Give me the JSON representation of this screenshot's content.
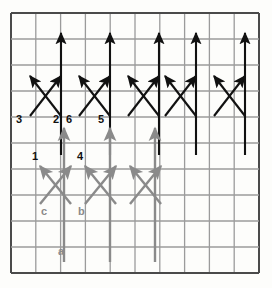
{
  "figure": {
    "background_color": "#fdfdfb",
    "dark_color": "#111111",
    "gray_color": "#8a8a8a",
    "grid_line_color": "#4a4a4a",
    "grid_minor_color": "#9b9b9b"
  },
  "grid": {
    "x0": 11,
    "y0": 13,
    "x1": 259,
    "y1": 273,
    "cols": 10,
    "rows": 10,
    "border_width": 2.0,
    "line_width": 1.3
  },
  "chart_data": {
    "type": "scatter",
    "xlabel": "",
    "ylabel": "",
    "legend": [],
    "series": [
      {
        "name": "black-vertical-arrows-top",
        "color": "#111111",
        "arrows": [
          {
            "x1": 61,
            "y1": 155,
            "x2": 61,
            "y2": 33
          },
          {
            "x1": 110,
            "y1": 155,
            "x2": 110,
            "y2": 33
          },
          {
            "x1": 159,
            "y1": 155,
            "x2": 159,
            "y2": 33
          },
          {
            "x1": 196,
            "y1": 155,
            "x2": 196,
            "y2": 33
          },
          {
            "x1": 245,
            "y1": 155,
            "x2": 245,
            "y2": 33
          }
        ]
      },
      {
        "name": "black-diagonal-up-left",
        "color": "#111111",
        "arrows": [
          {
            "x1": 61,
            "y1": 116,
            "x2": 30,
            "y2": 76
          },
          {
            "x1": 110,
            "y1": 116,
            "x2": 79,
            "y2": 76
          },
          {
            "x1": 159,
            "y1": 116,
            "x2": 128,
            "y2": 76
          },
          {
            "x1": 196,
            "y1": 116,
            "x2": 165,
            "y2": 76
          },
          {
            "x1": 245,
            "y1": 116,
            "x2": 214,
            "y2": 76
          }
        ]
      },
      {
        "name": "black-diagonal-up-right",
        "color": "#111111",
        "arrows": [
          {
            "x1": 30,
            "y1": 116,
            "x2": 61,
            "y2": 76
          },
          {
            "x1": 79,
            "y1": 116,
            "x2": 110,
            "y2": 76
          },
          {
            "x1": 128,
            "y1": 116,
            "x2": 159,
            "y2": 76
          },
          {
            "x1": 165,
            "y1": 116,
            "x2": 196,
            "y2": 76
          },
          {
            "x1": 214,
            "y1": 116,
            "x2": 245,
            "y2": 76
          }
        ]
      },
      {
        "name": "gray-vertical-arrows",
        "color": "#8a8a8a",
        "arrows": [
          {
            "x1": 64,
            "y1": 262,
            "x2": 64,
            "y2": 128
          },
          {
            "x1": 110,
            "y1": 262,
            "x2": 110,
            "y2": 128
          },
          {
            "x1": 155,
            "y1": 262,
            "x2": 155,
            "y2": 128
          }
        ]
      },
      {
        "name": "gray-diagonal-up-right",
        "color": "#8a8a8a",
        "arrows": [
          {
            "x1": 40,
            "y1": 204,
            "x2": 71,
            "y2": 166
          },
          {
            "x1": 85,
            "y1": 204,
            "x2": 116,
            "y2": 166
          },
          {
            "x1": 130,
            "y1": 204,
            "x2": 161,
            "y2": 166
          }
        ]
      },
      {
        "name": "gray-diagonal-up-left",
        "color": "#8a8a8a",
        "arrows": [
          {
            "x1": 71,
            "y1": 204,
            "x2": 40,
            "y2": 166
          },
          {
            "x1": 116,
            "y1": 204,
            "x2": 85,
            "y2": 166
          },
          {
            "x1": 161,
            "y1": 204,
            "x2": 130,
            "y2": 166
          }
        ]
      }
    ],
    "annotations": [
      {
        "text": "3",
        "x": 16,
        "y": 114,
        "color": "#111111"
      },
      {
        "text": "2",
        "x": 53,
        "y": 114,
        "color": "#111111"
      },
      {
        "text": "6",
        "x": 66,
        "y": 114,
        "color": "#111111"
      },
      {
        "text": "5",
        "x": 98,
        "y": 114,
        "color": "#111111"
      },
      {
        "text": "1",
        "x": 32,
        "y": 151,
        "color": "#111111"
      },
      {
        "text": "4",
        "x": 77,
        "y": 151,
        "color": "#111111"
      },
      {
        "text": "c",
        "x": 41,
        "y": 206,
        "color": "#8a8a8a"
      },
      {
        "text": "b",
        "x": 78,
        "y": 206,
        "color": "#8a8a8a"
      },
      {
        "text": "a",
        "x": 58,
        "y": 246,
        "color": "#8a8a8a"
      }
    ]
  },
  "labels": {
    "n3": "3",
    "n2": "2",
    "n6": "6",
    "n5": "5",
    "n1": "1",
    "n4": "4",
    "lc": "c",
    "lb": "b",
    "la": "a"
  }
}
